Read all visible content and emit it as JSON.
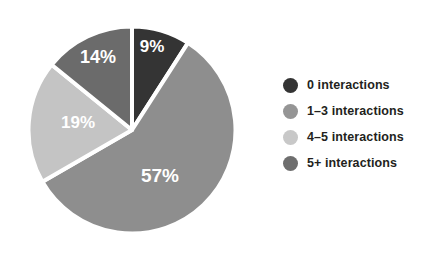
{
  "chart_data": {
    "type": "pie",
    "title": "",
    "subtitle": "",
    "xlabel": "",
    "ylabel": "",
    "grid": false,
    "legend_position": "right",
    "start_angle_deg": 0,
    "direction": "clockwise",
    "categories": [
      "0 interactions",
      "1–3 interactions",
      "4–5 interactions",
      "5+ interactions"
    ],
    "values": [
      9,
      57,
      19,
      14
    ],
    "value_unit": "%",
    "slices": [
      {
        "label": "0 interactions",
        "value": 9,
        "display": "9%",
        "color": "#343434",
        "label_x": 152,
        "label_y": 48
      },
      {
        "label": "1–3 interactions",
        "value": 57,
        "display": "57%",
        "color": "#8e8e8e",
        "label_x": 160,
        "label_y": 177
      },
      {
        "label": "4–5 interactions",
        "value": 19,
        "display": "19%",
        "color": "#c4c4c4",
        "label_x": 78,
        "label_y": 124
      },
      {
        "label": "5+ interactions",
        "value": 14,
        "display": "14%",
        "color": "#6b6b6b",
        "label_x": 98,
        "label_y": 58
      }
    ],
    "separator_color": "#ffffff",
    "label_text_color": "#ffffff"
  },
  "legend": {
    "items": [
      {
        "label": "0 interactions",
        "color": "#343434",
        "icon": "legend-dot-icon"
      },
      {
        "label": "1–3 interactions",
        "color": "#959595",
        "icon": "legend-dot-icon"
      },
      {
        "label": "4–5 interactions",
        "color": "#c8c8c8",
        "icon": "legend-dot-icon"
      },
      {
        "label": "5+ interactions",
        "color": "#6e6e6e",
        "icon": "legend-dot-icon"
      }
    ]
  },
  "labels": {
    "slice_0": "9%",
    "slice_1": "57%",
    "slice_2": "19%",
    "slice_3": "14%"
  }
}
